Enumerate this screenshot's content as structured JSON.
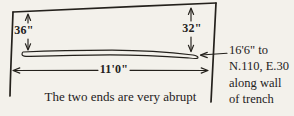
{
  "diagram": {
    "measurements": {
      "left_depth": "36\"",
      "right_depth": "32\"",
      "width": "11'0\""
    },
    "annotation": {
      "lines": [
        "16'6\" to",
        "N.110, E.30",
        "along wall",
        "of trench"
      ]
    },
    "caption": "The two ends are very abrupt",
    "colors": {
      "ink": "#24211c",
      "paper": "#f3f1eb"
    }
  }
}
